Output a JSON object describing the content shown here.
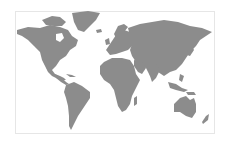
{
  "map": {
    "type": "world-map",
    "land_color": "#8c8c8c",
    "water_color": "#ffffff",
    "border_color": "#e6e6e6",
    "regions": [
      "North America",
      "Greenland",
      "South America",
      "Europe",
      "Africa",
      "Asia",
      "Australia",
      "New Zealand"
    ]
  }
}
